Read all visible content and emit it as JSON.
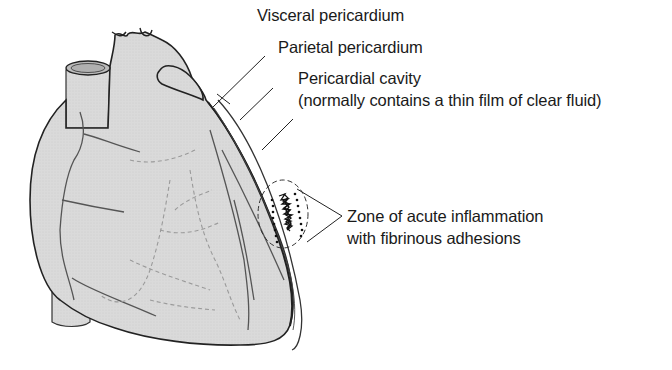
{
  "diagram": {
    "colors": {
      "heart_fill": "#d9d9d9",
      "outline": "#222222",
      "vessel_stroke": "#555555",
      "dashed_vessel": "#9a9a9a",
      "text": "#1a1a1a"
    },
    "labels": {
      "visceral": "Visceral pericardium",
      "parietal": "Parietal pericardium",
      "cavity_line1": "Pericardial cavity",
      "cavity_line2": "(normally contains a thin film of clear fluid)",
      "zone_line1": "Zone of acute inflammation",
      "zone_line2": "with fibrinous adhesions"
    }
  }
}
